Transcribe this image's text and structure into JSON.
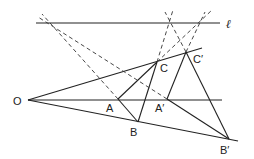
{
  "diagram": {
    "labels": {
      "O": "O",
      "A": "A",
      "B": "B",
      "C": "C",
      "A_prime": "A′",
      "B_prime": "B′",
      "C_prime": "C′",
      "line_l": "ℓ"
    },
    "points": {
      "O": [
        28,
        100
      ],
      "A": [
        118,
        99
      ],
      "B": [
        138,
        122
      ],
      "C": [
        157,
        62
      ],
      "A_prime": [
        167,
        99
      ],
      "B_prime": [
        229,
        139
      ],
      "C_prime": [
        186,
        52
      ]
    },
    "colors": {
      "stroke": "#222222",
      "background": "#ffffff"
    }
  }
}
